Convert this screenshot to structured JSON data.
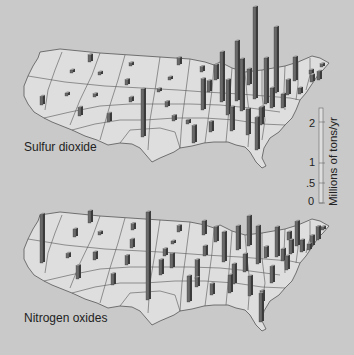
{
  "chart_data": [
    {
      "type": "bar",
      "subtype": "map-3d-bars",
      "title": "Sulfur dioxide",
      "unit": "Millions of tons/yr",
      "scale_ticks": [
        "0",
        ".5",
        "1",
        "2"
      ],
      "bars": [
        {
          "x": 40,
          "y": 105,
          "v": 0.22
        },
        {
          "x": 88,
          "y": 62,
          "v": 0.18
        },
        {
          "x": 70,
          "y": 73,
          "v": 0.06
        },
        {
          "x": 98,
          "y": 75,
          "v": 0.06
        },
        {
          "x": 129,
          "y": 66,
          "v": 0.08
        },
        {
          "x": 125,
          "y": 85,
          "v": 0.14
        },
        {
          "x": 65,
          "y": 96,
          "v": 0.06
        },
        {
          "x": 93,
          "y": 97,
          "v": 0.08
        },
        {
          "x": 129,
          "y": 102,
          "v": 0.12
        },
        {
          "x": 78,
          "y": 116,
          "v": 0.22
        },
        {
          "x": 107,
          "y": 122,
          "v": 0.22
        },
        {
          "x": 141,
          "y": 137,
          "v": 1.2
        },
        {
          "x": 177,
          "y": 65,
          "v": 0.18
        },
        {
          "x": 168,
          "y": 80,
          "v": 0.06
        },
        {
          "x": 157,
          "y": 92,
          "v": 0.08
        },
        {
          "x": 165,
          "y": 107,
          "v": 0.14
        },
        {
          "x": 172,
          "y": 121,
          "v": 0.14
        },
        {
          "x": 186,
          "y": 124,
          "v": 0.1
        },
        {
          "x": 200,
          "y": 72,
          "v": 0.14
        },
        {
          "x": 201,
          "y": 110,
          "v": 0.78
        },
        {
          "x": 207,
          "y": 92,
          "v": 0.28
        },
        {
          "x": 192,
          "y": 143,
          "v": 0.44
        },
        {
          "x": 209,
          "y": 132,
          "v": 0.26
        },
        {
          "x": 214,
          "y": 80,
          "v": 0.38
        },
        {
          "x": 220,
          "y": 102,
          "v": 1.25
        },
        {
          "x": 226,
          "y": 115,
          "v": 0.88
        },
        {
          "x": 230,
          "y": 131,
          "v": 0.6
        },
        {
          "x": 235,
          "y": 101,
          "v": 1.5
        },
        {
          "x": 240,
          "y": 111,
          "v": 1.3
        },
        {
          "x": 247,
          "y": 85,
          "v": 0.4
        },
        {
          "x": 246,
          "y": 135,
          "v": 0.65
        },
        {
          "x": 253,
          "y": 99,
          "v": 2.3
        },
        {
          "x": 255,
          "y": 150,
          "v": 0.82
        },
        {
          "x": 259,
          "y": 125,
          "v": 0.44
        },
        {
          "x": 264,
          "y": 104,
          "v": 1.15
        },
        {
          "x": 270,
          "y": 108,
          "v": 0.5
        },
        {
          "x": 274,
          "y": 93,
          "v": 1.65
        },
        {
          "x": 281,
          "y": 108,
          "v": 0.35
        },
        {
          "x": 286,
          "y": 95,
          "v": 0.38
        },
        {
          "x": 293,
          "y": 81,
          "v": 0.6
        },
        {
          "x": 298,
          "y": 94,
          "v": 0.15
        },
        {
          "x": 310,
          "y": 82,
          "v": 0.18
        },
        {
          "x": 320,
          "y": 67,
          "v": 0.08
        },
        {
          "x": 309,
          "y": 74,
          "v": 0.1
        },
        {
          "x": 317,
          "y": 80,
          "v": 0.22
        },
        {
          "x": 260,
          "y": 118,
          "v": 0.28
        }
      ]
    },
    {
      "type": "bar",
      "subtype": "map-3d-bars",
      "title": "Nitrogen oxides",
      "unit": "Millions of tons/yr",
      "bars": [
        {
          "x": 40,
          "y": 263,
          "v": 1.22
        },
        {
          "x": 88,
          "y": 223,
          "v": 0.3
        },
        {
          "x": 73,
          "y": 237,
          "v": 0.2
        },
        {
          "x": 98,
          "y": 235,
          "v": 0.08
        },
        {
          "x": 131,
          "y": 230,
          "v": 0.16
        },
        {
          "x": 130,
          "y": 248,
          "v": 0.22
        },
        {
          "x": 66,
          "y": 258,
          "v": 0.12
        },
        {
          "x": 93,
          "y": 260,
          "v": 0.2
        },
        {
          "x": 125,
          "y": 265,
          "v": 0.24
        },
        {
          "x": 76,
          "y": 279,
          "v": 0.34
        },
        {
          "x": 111,
          "y": 285,
          "v": 0.28
        },
        {
          "x": 146,
          "y": 300,
          "v": 2.2
        },
        {
          "x": 177,
          "y": 232,
          "v": 0.16
        },
        {
          "x": 171,
          "y": 244,
          "v": 0.06
        },
        {
          "x": 163,
          "y": 256,
          "v": 0.18
        },
        {
          "x": 170,
          "y": 268,
          "v": 0.36
        },
        {
          "x": 159,
          "y": 275,
          "v": 0.38
        },
        {
          "x": 187,
          "y": 302,
          "v": 0.65
        },
        {
          "x": 195,
          "y": 279,
          "v": 0.48
        },
        {
          "x": 202,
          "y": 235,
          "v": 0.35
        },
        {
          "x": 203,
          "y": 256,
          "v": 0.25
        },
        {
          "x": 195,
          "y": 287,
          "v": 0.24
        },
        {
          "x": 214,
          "y": 242,
          "v": 0.38
        },
        {
          "x": 222,
          "y": 262,
          "v": 0.75
        },
        {
          "x": 210,
          "y": 295,
          "v": 0.28
        },
        {
          "x": 228,
          "y": 293,
          "v": 0.45
        },
        {
          "x": 232,
          "y": 284,
          "v": 0.5
        },
        {
          "x": 236,
          "y": 250,
          "v": 0.6
        },
        {
          "x": 243,
          "y": 272,
          "v": 0.45
        },
        {
          "x": 247,
          "y": 246,
          "v": 0.75
        },
        {
          "x": 248,
          "y": 296,
          "v": 0.5
        },
        {
          "x": 256,
          "y": 264,
          "v": 0.95
        },
        {
          "x": 260,
          "y": 302,
          "v": 0.28
        },
        {
          "x": 259,
          "y": 322,
          "v": 0.72
        },
        {
          "x": 264,
          "y": 258,
          "v": 0.28
        },
        {
          "x": 270,
          "y": 283,
          "v": 0.42
        },
        {
          "x": 275,
          "y": 257,
          "v": 0.75
        },
        {
          "x": 281,
          "y": 261,
          "v": 0.3
        },
        {
          "x": 285,
          "y": 270,
          "v": 0.35
        },
        {
          "x": 287,
          "y": 240,
          "v": 0.2
        },
        {
          "x": 289,
          "y": 254,
          "v": 0.35
        },
        {
          "x": 295,
          "y": 246,
          "v": 0.62
        },
        {
          "x": 300,
          "y": 252,
          "v": 0.3
        },
        {
          "x": 310,
          "y": 246,
          "v": 0.26
        },
        {
          "x": 316,
          "y": 240,
          "v": 0.34
        },
        {
          "x": 321,
          "y": 230,
          "v": 0.08
        },
        {
          "x": 307,
          "y": 250,
          "v": 0.15
        }
      ]
    }
  ],
  "labels": {
    "so2_title": "Sulfur dioxide",
    "nox_title": "Nitrogen oxides",
    "scale_unit": "Millions of tons/yr",
    "tick_0": "0",
    "tick_05": ".5",
    "tick_1": "1",
    "tick_2": "2"
  },
  "colors": {
    "background": "#c9c9c9",
    "land": "#dedede",
    "border": "#555555",
    "bar_front": "#6a6a6a",
    "bar_side": "#3c3c3c",
    "bar_top": "#9a9a9a"
  },
  "scale": {
    "px_per_unit": 40
  }
}
